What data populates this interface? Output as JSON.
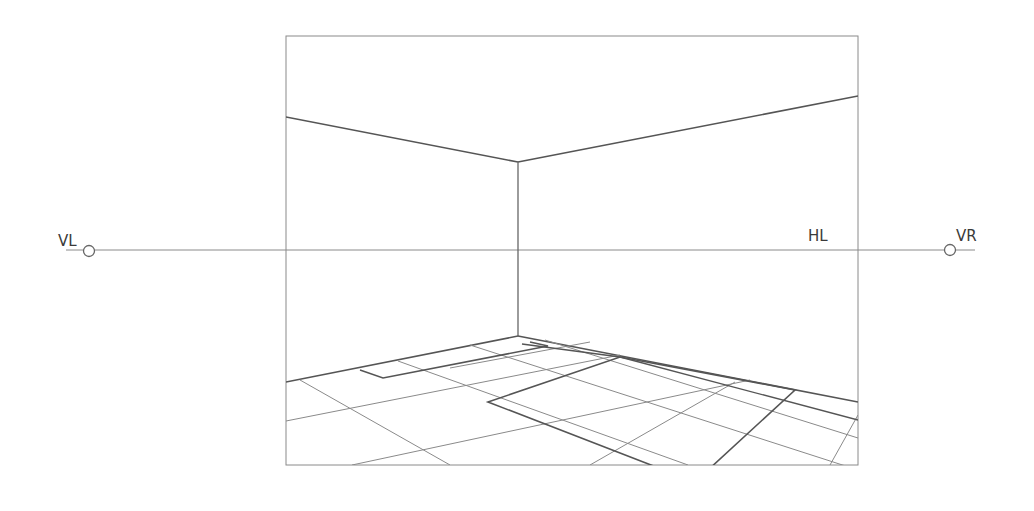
{
  "diagram": {
    "labels": {
      "vanishing_left": "VL",
      "vanishing_right": "VR",
      "horizon_line": "HL"
    },
    "colors": {
      "stroke": "#555555",
      "thin_stroke": "#8a8a8a",
      "background": "#ffffff"
    }
  }
}
